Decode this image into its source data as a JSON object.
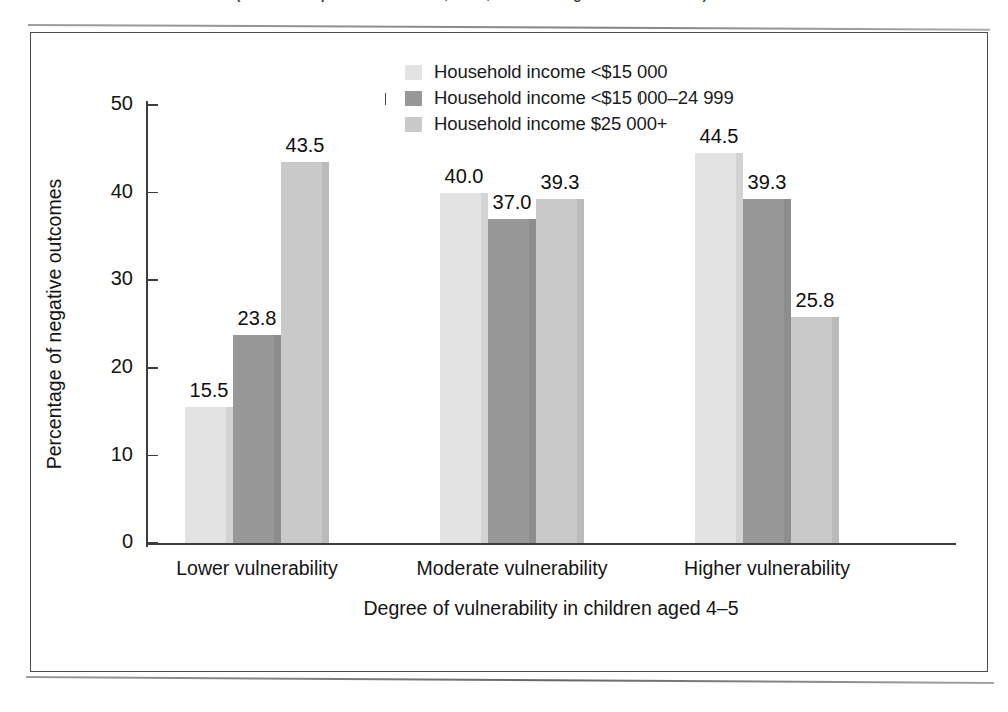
{
  "scan": {
    "clipped_caption": "(Source: Adapted from Kershaw, Forer, & Irwin in Right to Canada 2010.)"
  },
  "chart_data": {
    "type": "bar",
    "title": "",
    "xlabel": "Degree of vulnerability in children aged 4–5",
    "ylabel": "Percentage of negative outcomes",
    "categories": [
      "Lower vulnerability",
      "Moderate vulnerability",
      "Higher vulnerability"
    ],
    "series": [
      {
        "name": "Household income <$15 000",
        "color": "#e3e3e3",
        "values": [
          15.5,
          40.0,
          44.5
        ],
        "labels": [
          "15.5",
          "40.0",
          "44.5"
        ]
      },
      {
        "name": "Household income <$15 000–24 999",
        "color": "#989898",
        "values": [
          23.8,
          37.0,
          39.3
        ],
        "labels": [
          "23.8",
          "37.0",
          "39.3"
        ]
      },
      {
        "name": "Household income $25 000+",
        "color": "#c9c9c9",
        "values": [
          43.5,
          39.3,
          25.8
        ],
        "labels": [
          "43.5",
          "39.3",
          "25.8"
        ]
      }
    ],
    "ylim": [
      0,
      50
    ],
    "yticks": [
      0,
      10,
      20,
      30,
      40,
      50
    ],
    "ytick_labels": [
      "0",
      "10",
      "20",
      "30",
      "40",
      "50"
    ],
    "grid": false,
    "legend_position": "top-center"
  },
  "legend": {
    "items": [
      {
        "label": "Household income <$15 000",
        "swatch": "#e3e3e3"
      },
      {
        "label": "Household income <$15 000–24 999",
        "swatch": "#989898"
      },
      {
        "label": "Household income $25 000+",
        "swatch": "#c9c9c9"
      }
    ]
  }
}
